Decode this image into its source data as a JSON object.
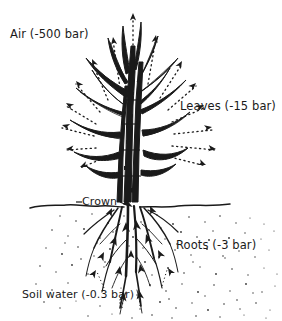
{
  "figure": {
    "type": "scientific-illustration",
    "background_color": "#ffffff",
    "ink_color": "#1a1a1a"
  },
  "labels": {
    "air": "Air (-500 bar)",
    "leaves": "Leaves (-15 bar)",
    "crown": "Crown",
    "roots": "Roots (-3 bar)",
    "soil_water": "Soil water (-0.3 bar)"
  },
  "annotations": {
    "air_icon": "air-label",
    "leaves_icon": "leaves-label",
    "crown_icon": "crown-label",
    "roots_icon": "roots-label",
    "soil_icon": "soil-water-label"
  },
  "diagram_parts": {
    "plant": "grass-plant-stem-and-leaves",
    "soil_line": "ground-surface-line",
    "soil_stipple": "soil-texture-stipple",
    "transpiration_arrows": "dotted-arrows-radiating-from-leaves",
    "uptake_arrows": "solid-arrows-along-roots-pointing-up",
    "root_system": "fibrous-root-system"
  }
}
